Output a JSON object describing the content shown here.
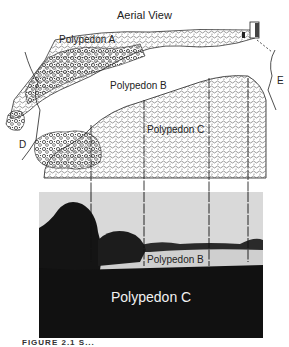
{
  "figure": {
    "title": "Aerial View",
    "aerial_labels": {
      "polypedon_a": "Polypedon A",
      "polypedon_b": "Polypedon B",
      "polypedon_c": "Polypedon C",
      "point_d": "D",
      "point_e": "E"
    },
    "photo_labels": {
      "polypedon_b": "Polypedon B",
      "polypedon_c": "Polypedon C"
    },
    "caption_partial": "FIGURE 2.1  S..."
  },
  "colors": {
    "ink": "#222222",
    "sky": "#d9d9d9",
    "field_light": "#cfcfcf",
    "field_dark": "#111111",
    "trees": "#1a1a1a"
  }
}
